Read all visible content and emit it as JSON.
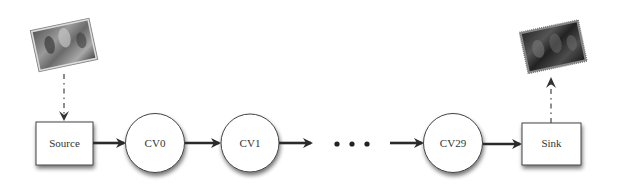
{
  "diagram": {
    "type": "pipeline",
    "nodes": [
      {
        "id": "source",
        "label": "Source",
        "shape": "rectangle"
      },
      {
        "id": "cv0",
        "label": "CV0",
        "shape": "circle"
      },
      {
        "id": "cv1",
        "label": "CV1",
        "shape": "circle"
      },
      {
        "id": "ellipsis",
        "label": "• • •",
        "shape": "text"
      },
      {
        "id": "cv29",
        "label": "CV29",
        "shape": "circle"
      },
      {
        "id": "sink",
        "label": "Sink",
        "shape": "rectangle"
      }
    ],
    "input_image": {
      "name": "input-photo",
      "direction": "into source"
    },
    "output_image": {
      "name": "output-photo",
      "direction": "out of sink"
    },
    "colors": {
      "stroke": "#444444",
      "arrow": "#2a2a2a",
      "shadow": "#9a9a9a",
      "fill": "#ffffff"
    }
  }
}
